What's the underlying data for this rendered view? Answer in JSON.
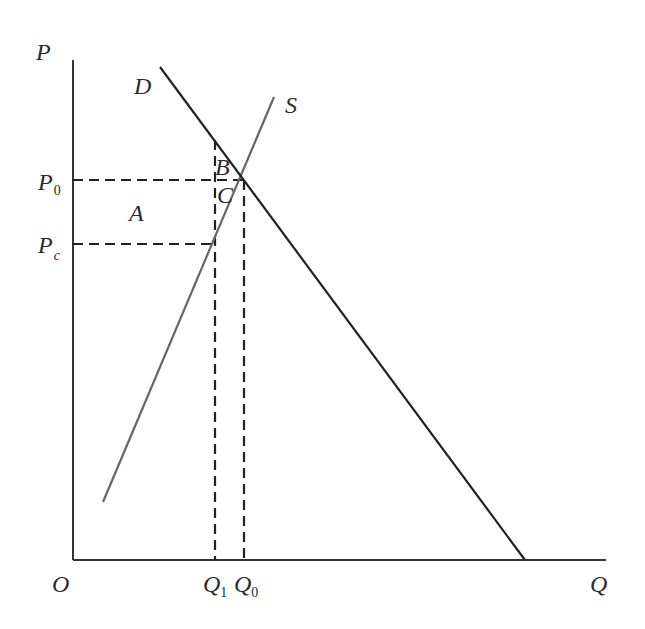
{
  "diagram": {
    "type": "supply-demand",
    "axes": {
      "y_label": "P",
      "x_label": "Q",
      "origin_label": "O"
    },
    "curves": {
      "demand": {
        "label": "D",
        "color": "#222222"
      },
      "supply": {
        "label": "S",
        "color": "#666666"
      }
    },
    "price_labels": {
      "p0": {
        "main": "P",
        "sub": "0"
      },
      "pc": {
        "main": "P",
        "sub": "c"
      }
    },
    "quantity_labels": {
      "q1": {
        "main": "Q",
        "sub": "1"
      },
      "q0": {
        "main": "Q",
        "sub": "0"
      }
    },
    "regions": {
      "a": "A",
      "b": "B",
      "c": "C"
    },
    "colors": {
      "axis": "#333333",
      "dashed": "#222222",
      "background": "#ffffff"
    }
  }
}
